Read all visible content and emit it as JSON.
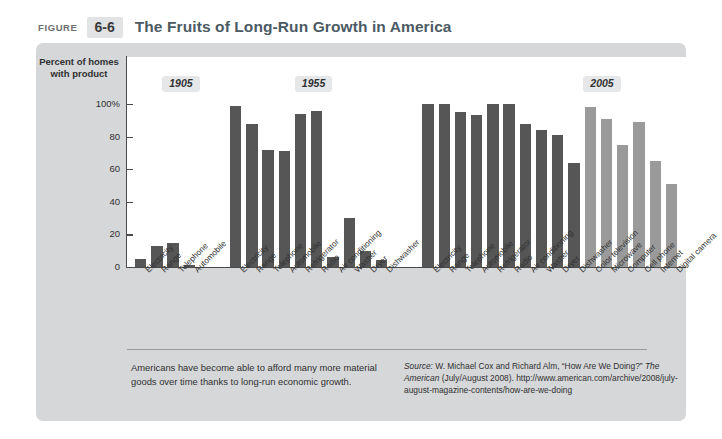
{
  "header": {
    "figure_word": "Figure",
    "figure_number": "6-6",
    "title": "The Fruits of Long-Run Growth in America"
  },
  "axis": {
    "y_title": "Percent of homes with product",
    "y_ticks": [
      "100%",
      "80",
      "60",
      "40",
      "20",
      "0"
    ],
    "y_tick_values": [
      100,
      80,
      60,
      40,
      20,
      0
    ]
  },
  "year_badges": [
    {
      "label": "1905"
    },
    {
      "label": "1955"
    },
    {
      "label": "2005"
    }
  ],
  "caption": "Americans have become able to afford many more material goods over time thanks to long-run economic growth.",
  "source": {
    "label": "Source:",
    "text": " W. Michael Cox and Richard Alm, “How Are We Doing?” ",
    "magazine": "The American",
    "rest": " (July/August 2008). http://www.american.com/archive/2008/july-august-magazine-contents/how-are-we-doing"
  },
  "colors": {
    "bar_dark": "#565656",
    "bar_light": "#9a9a9a",
    "panel": "#d6d7d8",
    "plot_bg": "#ffffff",
    "axis": "#4a4b4c",
    "title": "#4b5a63"
  },
  "chart_data": {
    "type": "bar",
    "title": "The Fruits of Long-Run Growth in America",
    "xlabel": "",
    "ylabel": "Percent of homes with product",
    "ylim": [
      0,
      100
    ],
    "grid": false,
    "legend": "none",
    "groups": [
      {
        "year": "1905",
        "categories": [
          "Electricity",
          "Range",
          "Telephone",
          "Automobile"
        ],
        "values": [
          5,
          13,
          15,
          1
        ],
        "shades": [
          "dark",
          "dark",
          "dark",
          "dark"
        ]
      },
      {
        "year": "1955",
        "categories": [
          "Electricity",
          "Range",
          "Telephone",
          "Automobile",
          "Refrigerator",
          "Radio",
          "Air conditioning",
          "Washer",
          "Dryer",
          "Dishwasher"
        ],
        "values": [
          99,
          88,
          72,
          71,
          94,
          96,
          6,
          30,
          10,
          4
        ],
        "shades": [
          "dark",
          "dark",
          "dark",
          "dark",
          "dark",
          "dark",
          "dark",
          "dark",
          "dark",
          "dark"
        ]
      },
      {
        "year": "2005",
        "categories": [
          "Electricity",
          "Range",
          "Telephone",
          "Automobile",
          "Refrigerator",
          "Radio",
          "Air conditioning",
          "Washer",
          "Dryer",
          "Dishwasher",
          "Color television",
          "Microwave",
          "Computer",
          "Cell phone",
          "Internet",
          "Digital camera"
        ],
        "values": [
          100,
          100,
          95,
          93,
          100,
          100,
          88,
          84,
          81,
          64,
          98,
          91,
          75,
          89,
          65,
          51
        ],
        "shades": [
          "dark",
          "dark",
          "dark",
          "dark",
          "dark",
          "dark",
          "dark",
          "dark",
          "dark",
          "dark",
          "light",
          "light",
          "light",
          "light",
          "light",
          "light"
        ]
      }
    ]
  }
}
